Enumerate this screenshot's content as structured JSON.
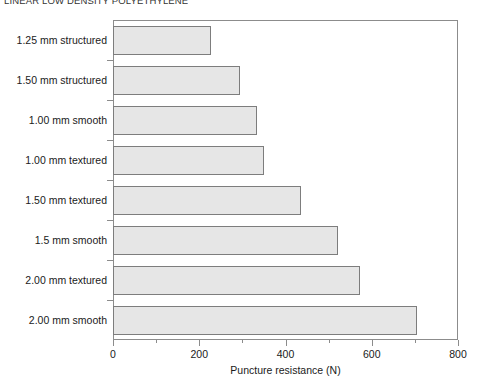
{
  "chart_data": {
    "type": "bar",
    "orientation": "horizontal",
    "title": "LINEAR LOW DENSITY POLYETHYLENE",
    "xlabel": "Puncture resistance (N)",
    "ylabel": "",
    "xlim": [
      0,
      800
    ],
    "xticks": [
      0,
      200,
      400,
      600,
      800
    ],
    "xtick_labels": [
      "0",
      "200",
      "400",
      "600",
      "800"
    ],
    "xminor_ticks": [
      100,
      300,
      500,
      700
    ],
    "grid": false,
    "legend": null,
    "categories": [
      "1.25 mm structured",
      "1.50 mm structured",
      "1.00 mm smooth",
      "1.00 mm textured",
      "1.50 mm textured",
      "1.5 mm smooth",
      "2.00 mm textured",
      "2.00 mm smooth"
    ],
    "values": [
      228,
      295,
      335,
      349,
      437,
      521,
      572,
      705
    ],
    "bar_fill_color": "#e6e6e6",
    "bar_edge_color": "#7d7d7d",
    "axis_color": "#8c8c8c"
  }
}
